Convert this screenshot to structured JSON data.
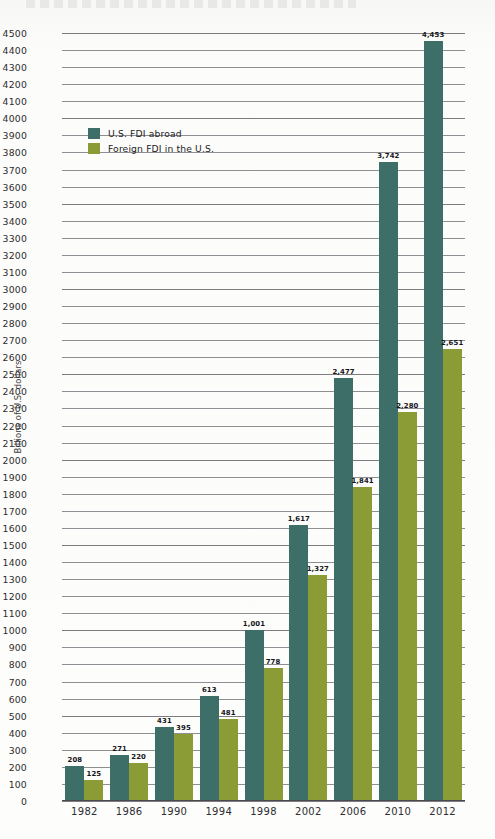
{
  "chart_data": {
    "type": "bar",
    "title": "",
    "subtitle": "",
    "xlabel": "",
    "ylabel": "Billions of U.S. dollars",
    "ylim": [
      0,
      4500
    ],
    "ytick_step": 100,
    "grid": true,
    "legend_position": "top-left",
    "categories": [
      "1982",
      "1986",
      "1990",
      "1994",
      "1998",
      "2002",
      "2006",
      "2010",
      "2012"
    ],
    "series": [
      {
        "name": "U.S. FDI abroad",
        "color": "#3d6f68",
        "values": [
          208,
          271,
          431,
          613,
          1001,
          1617,
          2477,
          3742,
          4453
        ],
        "value_labels": [
          "208",
          "271",
          "431",
          "613",
          "1,001",
          "1,617",
          "2,477",
          "3,742",
          "4,453"
        ]
      },
      {
        "name": "Foreign FDI in the U.S.",
        "color": "#8b9c36",
        "values": [
          125,
          220,
          395,
          481,
          778,
          1327,
          1841,
          2280,
          2651
        ],
        "value_labels": [
          "125",
          "220",
          "395",
          "481",
          "778",
          "1,327",
          "1,841",
          "2,280",
          "2,651"
        ]
      }
    ],
    "ytick_labels": [
      "4500",
      "4400",
      "4300",
      "4200",
      "4100",
      "4000",
      "3900",
      "3800",
      "3700",
      "3600",
      "3500",
      "3400",
      "3300",
      "3200",
      "3100",
      "3000",
      "2900",
      "2800",
      "2700",
      "2600",
      "2500",
      "2400",
      "2300",
      "2200",
      "2100",
      "2000",
      "1900",
      "1800",
      "1700",
      "1600",
      "1500",
      "1400",
      "1300",
      "1200",
      "1100",
      "1000",
      "900",
      "800",
      "700",
      "600",
      "500",
      "400",
      "300",
      "200",
      "100",
      "0"
    ]
  },
  "legend": {
    "items": [
      {
        "label": "U.S. FDI abroad",
        "color": "#3d6f68",
        "swatch": "legend-swatch-teal"
      },
      {
        "label": "Foreign FDI in the U.S.",
        "color": "#8b9c36",
        "swatch": "legend-swatch-olive"
      }
    ]
  },
  "axis": {
    "y_title": "Billions of U.S. dollars"
  }
}
